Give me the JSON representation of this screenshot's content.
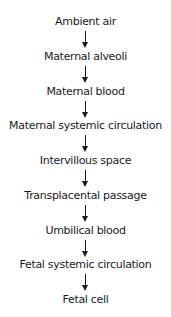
{
  "diagram": {
    "type": "vertical-flowchart",
    "nodes": [
      "Ambient air",
      "Maternal alveoli",
      "Maternal blood",
      "Maternal systemic circulation",
      "Intervillous space",
      "Transplacental passage",
      "Umbilical blood",
      "Fetal systemic circulation",
      "Fetal cell"
    ],
    "edges": [
      {
        "from": 0,
        "to": 1
      },
      {
        "from": 1,
        "to": 2
      },
      {
        "from": 2,
        "to": 3
      },
      {
        "from": 3,
        "to": 4
      },
      {
        "from": 4,
        "to": 5
      },
      {
        "from": 5,
        "to": 6
      },
      {
        "from": 6,
        "to": 7
      },
      {
        "from": 7,
        "to": 8
      }
    ],
    "arrow_icon": "down-arrow-icon",
    "colors": {
      "text": "#1a1a1a",
      "background": "#ffffff"
    }
  }
}
